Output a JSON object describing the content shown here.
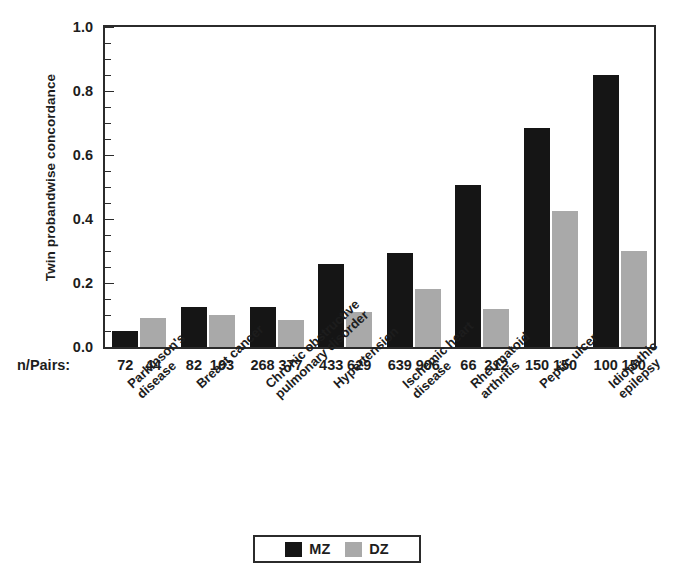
{
  "chart_data": {
    "type": "bar",
    "title": "",
    "xlabel": "",
    "ylabel": "Twin probandwise concordance",
    "ylim": [
      0.0,
      1.0
    ],
    "ytick_labels": [
      "0.0",
      "0.2",
      "0.4",
      "0.6",
      "0.8",
      "1.0"
    ],
    "ytick_values": [
      0.0,
      0.2,
      0.4,
      0.6,
      0.8,
      1.0
    ],
    "minor_tick_interval": 0.05,
    "grid": false,
    "legend_position": "bottom-center",
    "categories": [
      "Parkinson's disease",
      "Breast cancer",
      "Chronic obstructive pulmonary disorder",
      "Hypertension",
      "Ischemic heart disease",
      "Rheumatoid arthritis",
      "Peptic ulcer",
      "Idiopathic epilepsy"
    ],
    "category_lines": [
      [
        "Parkinson's",
        "disease"
      ],
      [
        "Breast cancer",
        ""
      ],
      [
        "Chronic obstructive",
        "pulmonary disorder"
      ],
      [
        "Hypertension",
        ""
      ],
      [
        "Ischemic heart",
        "disease"
      ],
      [
        "Rheumatoid",
        "arthritis"
      ],
      [
        "Peptic ulcer",
        ""
      ],
      [
        "Idiopathic",
        "epilepsy"
      ]
    ],
    "series": [
      {
        "name": "MZ",
        "color": "#151515",
        "values": [
          0.05,
          0.125,
          0.125,
          0.26,
          0.295,
          0.505,
          0.685,
          0.85
        ]
      },
      {
        "name": "DZ",
        "color": "#a9a9a9",
        "values": [
          0.09,
          0.1,
          0.085,
          0.11,
          0.18,
          0.12,
          0.425,
          0.3
        ]
      }
    ],
    "npairs_row_label": "n/Pairs:",
    "npairs": [
      {
        "mz": "72",
        "dz": "44"
      },
      {
        "mz": "82",
        "dz": "103"
      },
      {
        "mz": "268",
        "dz": "377"
      },
      {
        "mz": "433",
        "dz": "629"
      },
      {
        "mz": "639",
        "dz": "906"
      },
      {
        "mz": "66",
        "dz": "212"
      },
      {
        "mz": "150",
        "dz": "150"
      },
      {
        "mz": "100",
        "dz": "150"
      }
    ]
  },
  "legend": {
    "entries": [
      {
        "label": "MZ",
        "color": "#151515"
      },
      {
        "label": "DZ",
        "color": "#a9a9a9"
      }
    ]
  }
}
